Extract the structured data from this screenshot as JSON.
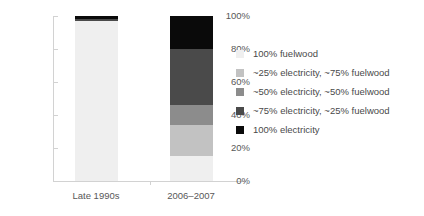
{
  "chart_data": {
    "type": "bar",
    "stacked": true,
    "title": "",
    "xlabel": "",
    "ylabel": "",
    "ylim": [
      0,
      100
    ],
    "grid": false,
    "legend_position": "right",
    "categories": [
      "Late 1990s",
      "2006–2007"
    ],
    "y_ticks": [
      "0%",
      "20%",
      "40%",
      "60%",
      "80%",
      "100%"
    ],
    "y_tick_values": [
      0,
      20,
      40,
      60,
      80,
      100
    ],
    "series": [
      {
        "name": "100% fuelwood",
        "color": "#efefef",
        "values": [
          97,
          15
        ]
      },
      {
        "name": "~25% electricity, ~75% fuelwood",
        "color": "#c2c2c2",
        "values": [
          0,
          19
        ]
      },
      {
        "name": "~50% electricity, ~50% fuelwood",
        "color": "#8c8c8c",
        "values": [
          0,
          12
        ]
      },
      {
        "name": "~75% electricity, ~25% fuelwood",
        "color": "#4a4a4a",
        "values": [
          1,
          34
        ]
      },
      {
        "name": "100% electricity",
        "color": "#0a0a0a",
        "values": [
          2,
          20
        ]
      }
    ]
  },
  "legend": {
    "items": [
      {
        "label": "100% fuelwood",
        "color": "#efefef"
      },
      {
        "label": "~25% electricity, ~75% fuelwood",
        "color": "#c2c2c2"
      },
      {
        "label": "~50% electricity, ~50% fuelwood",
        "color": "#8c8c8c"
      },
      {
        "label": "~75% electricity, ~25% fuelwood",
        "color": "#4a4a4a"
      },
      {
        "label": "100% electricity",
        "color": "#0a0a0a"
      }
    ]
  },
  "axis": {
    "labels": [
      "100%",
      "80%",
      "60%",
      "40%",
      "20%",
      "0%"
    ]
  }
}
